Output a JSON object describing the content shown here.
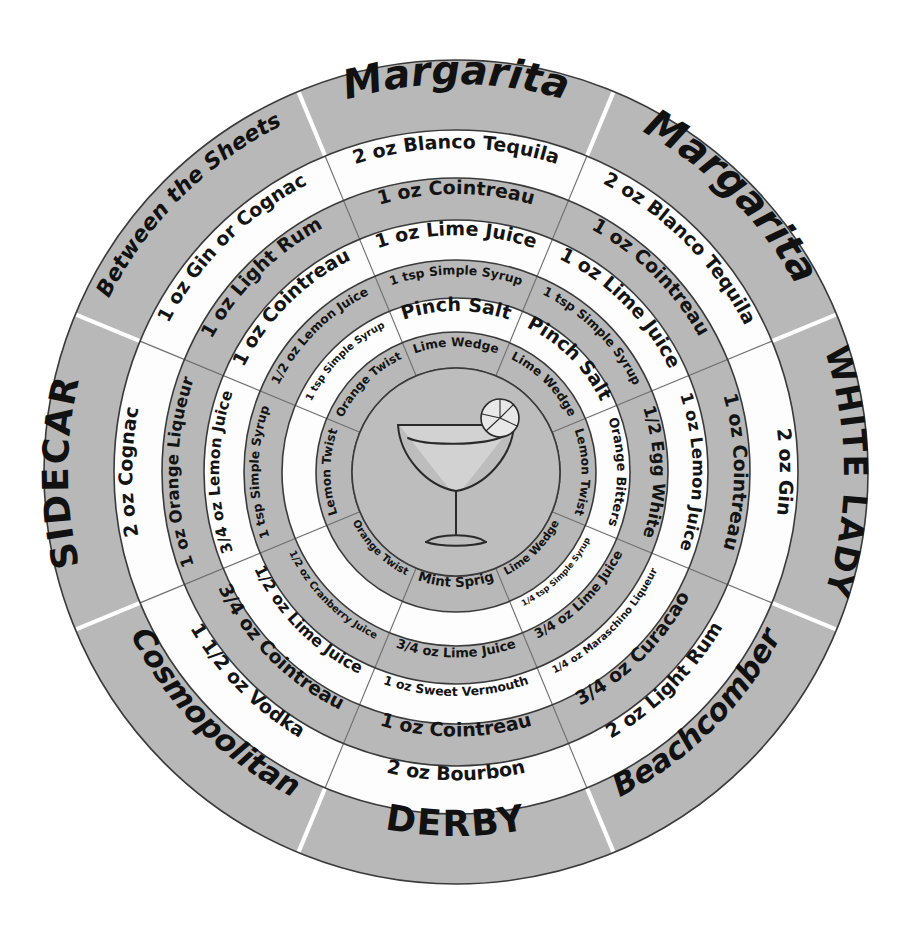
{
  "figure": {
    "center_icon": "coupe-glass-with-lime-wheel",
    "ring_count": 7,
    "sector_count": 8
  },
  "palette": {
    "ring_dark": "#b8b8b8",
    "ring_light": "#fdfdfd",
    "hub": "#bdbdbd",
    "outline": "#3a3a3a",
    "divider": "#6e6e6e",
    "text": "#141414"
  },
  "chart_data": {
    "type": "pie",
    "legend": "none",
    "categories": [
      "Margarita",
      "White Lady",
      "Beachcomber",
      "Derby",
      "Cosmopolitan",
      "Sidecar",
      "Between the Sheets"
    ],
    "values": [
      45,
      45,
      45,
      45,
      45,
      45,
      45
    ],
    "rings": [
      "name",
      "spirit",
      "liqueur",
      "citrus",
      "sweetener",
      "modifier",
      "garnish"
    ],
    "sectors": [
      {
        "name": "Margarita",
        "style": "script",
        "start_angle": -67.5,
        "end_angle": -22.5,
        "ingredients": [
          "2 oz Blanco Tequila",
          "1 oz Cointreau",
          "1 oz Lime Juice",
          "1 tsp Simple Syrup",
          "Pinch Salt"
        ],
        "garnish": "Lime Wedge"
      },
      {
        "name": "WHITE LADY",
        "style": "caps",
        "start_angle": -22.5,
        "end_angle": 22.5,
        "ingredients": [
          "2 oz Gin",
          "1 oz Cointreau",
          "1 oz Lemon Juice",
          "1/2 Egg White",
          "Orange Bitters"
        ],
        "garnish": "Lemon Twist"
      },
      {
        "name": "Beachcomber",
        "style": "script",
        "start_angle": 22.5,
        "end_angle": 67.5,
        "ingredients": [
          "2 oz Light Rum",
          "3/4 oz Curacao",
          "1/4 oz Maraschino Liqueur",
          "3/4 oz Lime Juice",
          "1/4 tsp Simple Syrup"
        ],
        "garnish": "Lime Wedge"
      },
      {
        "name": "DERBY",
        "style": "caps",
        "start_angle": 67.5,
        "end_angle": 112.5,
        "ingredients": [
          "2 oz Bourbon",
          "1 oz Cointreau",
          "1 oz Sweet Vermouth",
          "3/4 oz Lime Juice"
        ],
        "garnish": "Mint Sprig"
      },
      {
        "name": "Cosmopolitan",
        "style": "script",
        "start_angle": 112.5,
        "end_angle": 157.5,
        "ingredients": [
          "1 1/2 oz Vodka",
          "3/4 oz Cointreau",
          "1/2 oz Lime Juice",
          "1/2 oz Cranberry Juice"
        ],
        "garnish": "Orange Twist"
      },
      {
        "name": "SIDECAR",
        "style": "caps",
        "start_angle": 157.5,
        "end_angle": 202.5,
        "ingredients": [
          "2 oz Cognac",
          "1 oz Orange Liqueur",
          "3/4 oz Lemon Juice",
          "1 tsp Simple Syrup"
        ],
        "garnish": "Lemon Twist"
      },
      {
        "name": "Between the Sheets",
        "style": "script",
        "start_angle": 202.5,
        "end_angle": 247.5,
        "ingredients": [
          "1 oz Gin or Cognac",
          "1 oz Light Rum",
          "1 oz Cointreau",
          "1/2 oz Lemon Juice",
          "1 tsp Simple Syrup"
        ],
        "garnish": "Orange Twist"
      },
      {
        "name": "Margarita",
        "style": "script",
        "start_angle": 247.5,
        "end_angle": 292.5,
        "ingredients": [
          "2 oz Blanco Tequila",
          "1 oz Cointreau",
          "1 oz Lime Juice",
          "1 tsp Simple Syrup",
          "Pinch Salt"
        ],
        "garnish": "Lime Wedge"
      }
    ]
  }
}
